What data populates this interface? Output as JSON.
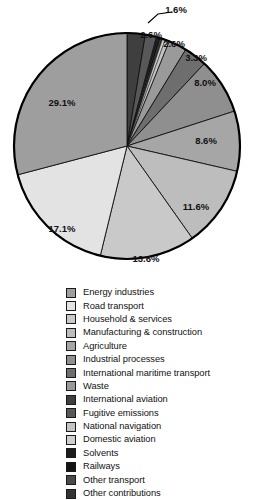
{
  "chart_data": {
    "type": "pie",
    "title": "",
    "subtitle": "",
    "xlabel": "",
    "ylabel": "",
    "legend_position": "bottom",
    "grid": false,
    "value_suffix": "%",
    "categories": [
      "Energy industries",
      "Road transport",
      "Household & services",
      "Manufacturing & construction",
      "Agriculture",
      "Industrial processes",
      "International maritime transport",
      "Waste",
      "International aviation",
      "Fugitive emissions",
      "National navigation",
      "Domestic aviation",
      "Solvents",
      "Railways",
      "Other transport",
      "Other contributions"
    ],
    "values": [
      29.1,
      17.1,
      13.6,
      11.6,
      8.6,
      8.0,
      3.3,
      2.6,
      2.6,
      1.6,
      0.6,
      0.4,
      0.3,
      0.3,
      0.2,
      0.1
    ],
    "colors": [
      "#9e9e9e",
      "#e3e3e3",
      "#c9c9c9",
      "#bdbdbd",
      "#a6a6a6",
      "#8f8f8f",
      "#6e6e6e",
      "#9a9a9a",
      "#3f3f3f",
      "#585858",
      "#c4c4c4",
      "#cfcfcf",
      "#1c1c1c",
      "#141414",
      "#4a4a4a",
      "#333333"
    ],
    "displayed_labels": [
      {
        "text": "29.1%",
        "x": 62,
        "y": 103
      },
      {
        "text": "17.1%",
        "x": 62,
        "y": 229
      },
      {
        "text": "13.6%",
        "x": 146,
        "y": 259
      },
      {
        "text": "11.6%",
        "x": 196,
        "y": 207
      },
      {
        "text": "8.6%",
        "x": 206,
        "y": 141
      },
      {
        "text": "8.0%",
        "x": 205,
        "y": 83
      },
      {
        "text": "3.3%",
        "x": 196,
        "y": 58
      },
      {
        "text": "2.6%",
        "x": 174,
        "y": 44
      },
      {
        "text": "2.6%",
        "x": 151,
        "y": 35
      },
      {
        "text": "1.6%",
        "x": 176,
        "y": 10
      }
    ]
  },
  "legend": {
    "items": [
      {
        "label": "Energy industries",
        "color": "#9e9e9e"
      },
      {
        "label": "Road transport",
        "color": "#e3e3e3"
      },
      {
        "label": "Household & services",
        "color": "#c9c9c9"
      },
      {
        "label": "Manufacturing & construction",
        "color": "#bdbdbd"
      },
      {
        "label": "Agriculture",
        "color": "#a6a6a6"
      },
      {
        "label": "Industrial processes",
        "color": "#8f8f8f"
      },
      {
        "label": "International maritime transport",
        "color": "#6e6e6e"
      },
      {
        "label": "Waste",
        "color": "#9a9a9a"
      },
      {
        "label": "International aviation",
        "color": "#3f3f3f"
      },
      {
        "label": "Fugitive emissions",
        "color": "#585858"
      },
      {
        "label": "National navigation",
        "color": "#c4c4c4"
      },
      {
        "label": "Domestic aviation",
        "color": "#cfcfcf"
      },
      {
        "label": "Solvents",
        "color": "#1c1c1c"
      },
      {
        "label": "Railways",
        "color": "#141414"
      },
      {
        "label": "Other transport",
        "color": "#4a4a4a"
      },
      {
        "label": "Other contributions",
        "color": "#333333"
      }
    ]
  }
}
